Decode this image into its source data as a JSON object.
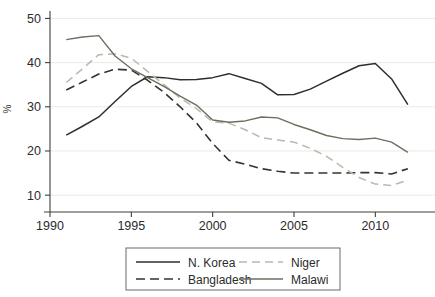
{
  "chart_data": {
    "type": "line",
    "title": "",
    "xlabel": "",
    "ylabel": "%",
    "xlim": [
      1990,
      2012.5
    ],
    "ylim": [
      8,
      51
    ],
    "grid": true,
    "grid_axis": "y",
    "legend_position": "bottom",
    "x_ticks": [
      1990,
      1995,
      2000,
      2005,
      2010
    ],
    "x_tick_labels": [
      "1990",
      "1995",
      "2000",
      "2005",
      "2010"
    ],
    "y_ticks": [
      10,
      20,
      30,
      40,
      50
    ],
    "y_tick_labels": [
      "10",
      "20",
      "30",
      "40",
      "50"
    ],
    "x": [
      1991,
      1992,
      1993,
      1994,
      1995,
      1996,
      1997,
      1998,
      1999,
      2000,
      2001,
      2002,
      2003,
      2004,
      2005,
      2006,
      2007,
      2008,
      2009,
      2010,
      2011,
      2012
    ],
    "series": [
      {
        "name": "N. Korea",
        "color": "#2e2e2c",
        "dash": "none",
        "width": 1.5,
        "values": [
          23.6,
          25.6,
          27.7,
          31.2,
          34.6,
          36.8,
          36.6,
          36.1,
          36.2,
          36.6,
          37.5,
          36.4,
          35.3,
          32.7,
          32.8,
          34.0,
          35.8,
          37.6,
          39.3,
          39.8,
          36.3,
          30.5
        ]
      },
      {
        "name": "Bangladesh",
        "color": "#33332f",
        "dash": "9,5",
        "width": 1.6,
        "values": [
          33.8,
          35.6,
          37.4,
          38.5,
          38.3,
          36.0,
          33.3,
          30.0,
          26.4,
          21.7,
          17.9,
          17.0,
          16.0,
          15.4,
          15.0,
          15.0,
          15.0,
          15.0,
          15.1,
          15.1,
          14.8,
          16.0
        ]
      },
      {
        "name": "Niger",
        "color": "#b9b9ad",
        "dash": "8,5",
        "width": 1.5,
        "values": [
          35.5,
          38.6,
          41.8,
          42.0,
          41.0,
          38.0,
          35.0,
          32.0,
          29.6,
          26.6,
          26.3,
          24.8,
          23.0,
          22.5,
          22.0,
          20.6,
          18.8,
          16.3,
          14.0,
          12.5,
          12.2,
          13.4
        ]
      },
      {
        "name": "Malawi",
        "color": "#6e6e60",
        "dash": "none",
        "width": 1.4,
        "values": [
          45.2,
          45.8,
          46.1,
          41.5,
          38.6,
          36.6,
          34.6,
          32.4,
          30.4,
          27.0,
          26.5,
          26.8,
          27.7,
          27.5,
          26.0,
          24.8,
          23.5,
          22.8,
          22.6,
          22.9,
          22.0,
          19.7
        ]
      }
    ],
    "legend": {
      "entries": [
        {
          "label": "N. Korea",
          "color": "#2e2e2c",
          "dash": "none"
        },
        {
          "label": "Niger",
          "color": "#b9b9ad",
          "dash": "8,5"
        },
        {
          "label": "Bangladesh",
          "color": "#33332f",
          "dash": "9,5"
        },
        {
          "label": "Malawi",
          "color": "#6e6e60",
          "dash": "none"
        }
      ]
    }
  }
}
